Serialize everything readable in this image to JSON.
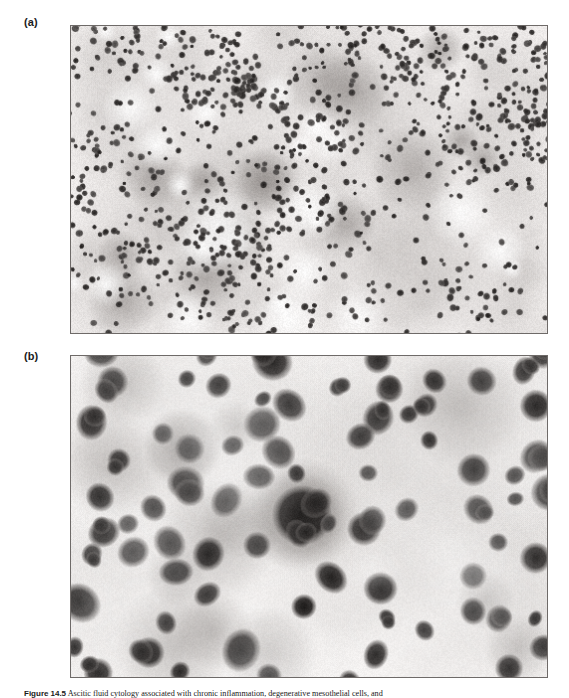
{
  "figure": {
    "panels": [
      {
        "id": "a",
        "label": "(a)",
        "name": "micrograph-panel-a",
        "description": "Low-magnification cytology smear: dense, evenly dispersed population of small dark-stained round inflammatory cells (neutrophils/lymphocytes) over a pale proteinaceous background with scattered larger pale clusters of mesothelial cells.",
        "magnification": "low",
        "stain": "Romanowsky / Wright-Giemsa",
        "background_color": "#f2efee",
        "cell_color": "#2b2725",
        "cell_count_approx": 1150,
        "cell_radius_px": [
          2.2,
          4.0
        ]
      },
      {
        "id": "b",
        "label": "(b)",
        "name": "micrograph-panel-b",
        "description": "High-magnification view: individual nucleated cells with dark heterochromatic nuclei, several degenerate and binucleate forms, one large reactive mesothelial cell with abundant pale cytoplasm near centre.",
        "magnification": "high",
        "stain": "Romanowsky / Wright-Giemsa",
        "background_color": "#f6f4f3",
        "cell_color": "#1d1a19",
        "cell_count_approx": 78,
        "cell_radius_px": [
          9,
          20
        ]
      }
    ],
    "caption": {
      "prefix": "Figure",
      "number": "14.5",
      "text": "Ascitic fluid cytology associated with chronic inflammation, degenerative mesothelial cells, and"
    }
  }
}
